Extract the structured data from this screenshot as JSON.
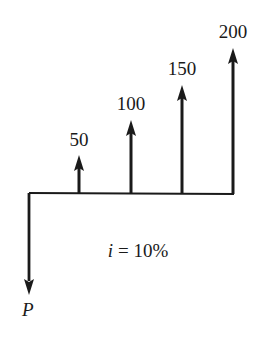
{
  "diagram": {
    "type": "cash-flow-diagram",
    "interest_label": "i = 10%",
    "interest_var": "i",
    "interest_value": "= 10%",
    "present_value_label": "P",
    "line_color": "#1a1a1a",
    "cash_flows": [
      {
        "period": 0,
        "label": "P",
        "direction": "down"
      },
      {
        "period": 1,
        "label": "50",
        "amount": 50,
        "direction": "up"
      },
      {
        "period": 2,
        "label": "100",
        "amount": 100,
        "direction": "up"
      },
      {
        "period": 3,
        "label": "150",
        "amount": 150,
        "direction": "up"
      },
      {
        "period": 4,
        "label": "200",
        "amount": 200,
        "direction": "up"
      }
    ]
  }
}
